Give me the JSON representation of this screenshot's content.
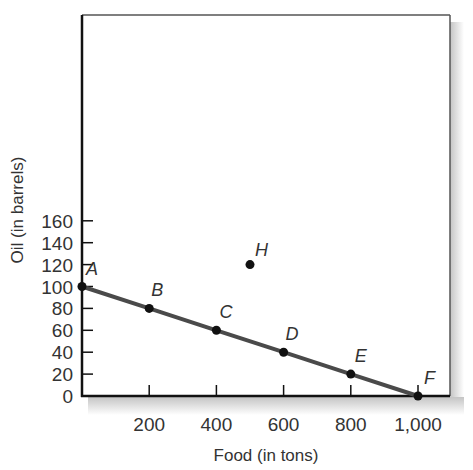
{
  "chart_data": {
    "type": "line",
    "title": "",
    "xlabel": "Food (in tons)",
    "ylabel": "Oil (in barrels)",
    "xlim": [
      0,
      1000
    ],
    "ylim": [
      0,
      170
    ],
    "x_ticks": [
      "200",
      "400",
      "600",
      "800",
      "1,000"
    ],
    "y_ticks": [
      "0",
      "20",
      "40",
      "60",
      "80",
      "100",
      "120",
      "140",
      "160"
    ],
    "grid": false,
    "series": [
      {
        "name": "Production possibilities frontier",
        "points": [
          {
            "label": "A",
            "x": 0,
            "y": 100
          },
          {
            "label": "B",
            "x": 200,
            "y": 80
          },
          {
            "label": "C",
            "x": 400,
            "y": 60
          },
          {
            "label": "D",
            "x": 600,
            "y": 40
          },
          {
            "label": "E",
            "x": 800,
            "y": 20
          },
          {
            "label": "F",
            "x": 1000,
            "y": 0
          }
        ]
      },
      {
        "name": "Unattainable point",
        "points": [
          {
            "label": "H",
            "x": 500,
            "y": 120
          }
        ]
      }
    ],
    "line_color": "#4a4a4a",
    "point_color": "#111111"
  }
}
